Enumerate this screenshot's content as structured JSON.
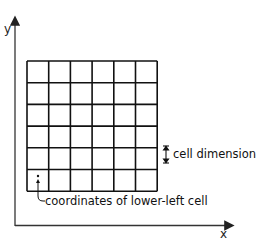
{
  "axes": {
    "x_label": "x",
    "y_label": "y"
  },
  "grid": {
    "rows": 6,
    "cols": 6,
    "left": 27,
    "top": 61,
    "cell_size": 21.7,
    "line_color": "#111111"
  },
  "annotations": {
    "cell_dimension": "cell dimension",
    "lower_left": "coordinates of lower-left cell"
  },
  "colors": {
    "axis": "#333333",
    "grid": "#111111",
    "text": "#111111"
  }
}
